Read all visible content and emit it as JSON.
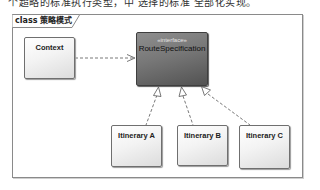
{
  "caption_fragment": "个超略的标准执行类型，中 选择的标准 全部化实现。",
  "frame": {
    "kind": "class",
    "name": "策略模式",
    "label": "class 策略模式"
  },
  "classes": {
    "context": {
      "name": "Context"
    },
    "route_specification": {
      "stereotype": "«interface»",
      "name": "RouteSpecification"
    },
    "itinerary_a": {
      "name": "Itinerary A"
    },
    "itinerary_b": {
      "name": "Itinerary B"
    },
    "itinerary_c": {
      "name": "Itinerary C"
    }
  },
  "relationships": [
    {
      "type": "dependency",
      "from": "Context",
      "to": "RouteSpecification"
    },
    {
      "type": "realization",
      "from": "Itinerary A",
      "to": "RouteSpecification"
    },
    {
      "type": "realization",
      "from": "Itinerary B",
      "to": "RouteSpecification"
    },
    {
      "type": "realization",
      "from": "Itinerary C",
      "to": "RouteSpecification"
    }
  ],
  "colors": {
    "interface_fill": "#777777",
    "class_fill": "#f3f3f3",
    "frame_border": "#8a8a8a",
    "edge": "#555555"
  }
}
